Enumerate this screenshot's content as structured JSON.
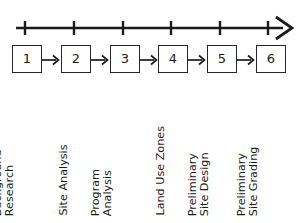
{
  "figure": {
    "type": "process-timeline-diagram",
    "line_color": "#1b1b1b",
    "box_border_color": "#262626",
    "background_color": "#ffffff",
    "axis": {
      "name": "time-axis",
      "direction": "left-to-right",
      "has_arrowhead_right": true,
      "tick_count": 6,
      "tick_labels": [
        "",
        "",
        "",
        "",
        "",
        ""
      ]
    },
    "stages": [
      {
        "number": "1",
        "label_lines": [
          "Background",
          "Research"
        ],
        "label_text": "Background Research"
      },
      {
        "number": "2",
        "label_lines": [
          "Site Analysis"
        ],
        "label_text": "Site Analysis"
      },
      {
        "number": "3",
        "label_lines": [
          "Program",
          "Analysis"
        ],
        "label_text": "Program Analysis"
      },
      {
        "number": "4",
        "label_lines": [
          "Land Use Zones"
        ],
        "label_text": "Land Use Zones"
      },
      {
        "number": "5",
        "label_lines": [
          "Preliminary",
          "Site Design"
        ],
        "label_text": "Preliminary Site Design"
      },
      {
        "number": "6",
        "label_lines": [
          "Preliminary",
          "Site Grading"
        ],
        "label_text": "Preliminary Site Grading"
      }
    ],
    "connector": {
      "name": "right-arrow",
      "between_stages": true,
      "count": 5
    },
    "caption": {
      "text": "",
      "visible": "clipped"
    }
  }
}
